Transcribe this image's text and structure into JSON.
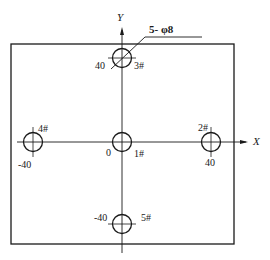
{
  "diagram": {
    "type": "hole-pattern-drawing",
    "colors": {
      "line": "#1a1a1a",
      "background": "#ffffff"
    },
    "axes": {
      "x_label": "X",
      "y_label": "Y",
      "origin_label": "0"
    },
    "spec_callout": "5- φ8",
    "holes": [
      {
        "id": "1#",
        "label": "1#",
        "x": 0,
        "y": 0
      },
      {
        "id": "2#",
        "label": "2#",
        "x": 40,
        "y": 0
      },
      {
        "id": "3#",
        "label": "3#",
        "x": 0,
        "y": 40
      },
      {
        "id": "4#",
        "label": "4#",
        "x": -40,
        "y": 0
      },
      {
        "id": "5#",
        "label": "5#",
        "x": 0,
        "y": -40
      }
    ],
    "dimensions": {
      "x_pos": "40",
      "x_neg": "-40",
      "y_pos": "40",
      "y_neg": "-40"
    }
  }
}
